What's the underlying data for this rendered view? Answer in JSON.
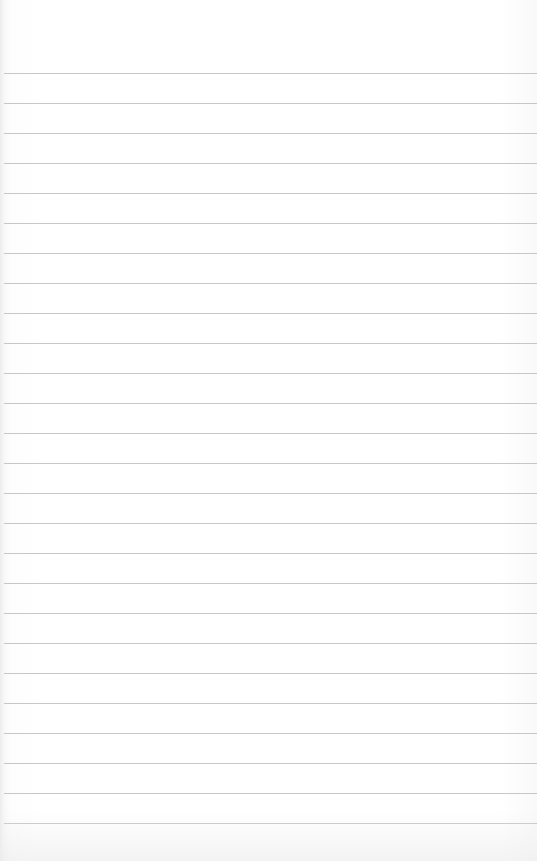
{
  "paper": {
    "type": "lined-paper",
    "background_color": "#ffffff",
    "rule_color": "#bdbdbd",
    "first_rule_y": 73,
    "rule_spacing": 30,
    "rule_count": 26
  }
}
